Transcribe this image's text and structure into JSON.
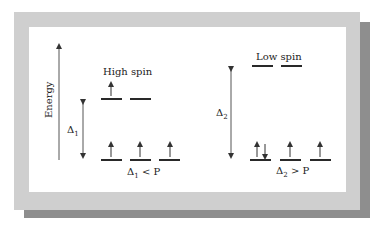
{
  "diagram": {
    "axis_label": "Energy",
    "high_spin": {
      "title": "High spin",
      "delta_label": "Δ",
      "delta_sub": "1",
      "condition_prefix": "Δ",
      "condition_sub": "1",
      "condition_suffix": " < P",
      "upper_levels": [
        {
          "electrons": "up"
        },
        {
          "electrons": ""
        }
      ],
      "lower_levels": [
        {
          "electrons": "up"
        },
        {
          "electrons": "up"
        },
        {
          "electrons": "up"
        }
      ]
    },
    "low_spin": {
      "title": "Low spin",
      "delta_label": "Δ",
      "delta_sub": "2",
      "condition_prefix": "Δ",
      "condition_sub": "2",
      "condition_suffix": " > P",
      "upper_levels": [
        {
          "electrons": ""
        },
        {
          "electrons": ""
        }
      ],
      "lower_levels": [
        {
          "electrons": "up-down"
        },
        {
          "electrons": "up"
        },
        {
          "electrons": "up"
        }
      ]
    }
  }
}
